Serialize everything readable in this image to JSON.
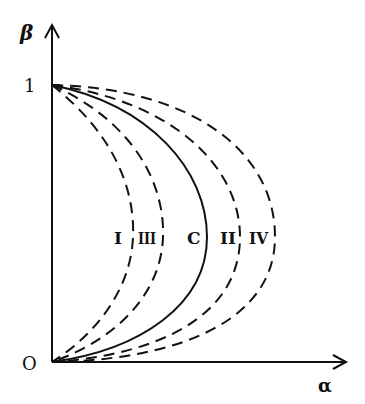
{
  "axes": {
    "y_label": "β",
    "x_label": "α",
    "y_tick_one": "1",
    "origin_label": "O"
  },
  "curves": [
    {
      "id": "I",
      "label": "I",
      "style": "dashed"
    },
    {
      "id": "III",
      "label": "III",
      "style": "dashed"
    },
    {
      "id": "C",
      "label": "C",
      "style": "solid"
    },
    {
      "id": "II",
      "label": "II",
      "style": "dashed"
    },
    {
      "id": "IV",
      "label": "IV",
      "style": "dashed"
    }
  ],
  "colors": {
    "ink": "#111111",
    "background": "#ffffff"
  }
}
